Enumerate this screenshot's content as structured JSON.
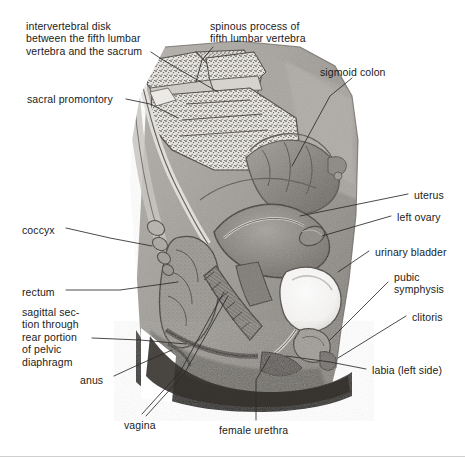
{
  "figure": {
    "style": "grayscale anatomical engraving",
    "width": 465,
    "height": 457,
    "background_color": "#ffffff",
    "text_color": "#1b1b1b",
    "leader_line_color": "#2a2a2a"
  },
  "labels": [
    {
      "id": "intervertebral-disk",
      "text": "intervertebral disk\nbetween the fifth lumbar\nvertebra and the sacrum",
      "lines": [
        "intervertebral disk",
        "between the fifth lumbar",
        "vertebra and the sacrum"
      ],
      "side": "left",
      "x": 26,
      "y": 20
    },
    {
      "id": "spinous-process",
      "text": "spinous process of\nfifth lumbar vertebra",
      "lines": [
        "spinous process of",
        "fifth lumbar vertebra"
      ],
      "side": "top",
      "x": 210,
      "y": 20
    },
    {
      "id": "sigmoid-colon",
      "text": "sigmoid colon",
      "lines": [
        "sigmoid colon"
      ],
      "side": "top-right",
      "x": 320,
      "y": 66
    },
    {
      "id": "sacral-promontory",
      "text": "sacral promontory",
      "lines": [
        "sacral promontory"
      ],
      "side": "left",
      "x": 27,
      "y": 93
    },
    {
      "id": "uterus",
      "text": "uterus",
      "lines": [
        "uterus"
      ],
      "side": "right",
      "x": 414,
      "y": 189
    },
    {
      "id": "left-ovary",
      "text": "left ovary",
      "lines": [
        "left ovary"
      ],
      "side": "right",
      "x": 397,
      "y": 211
    },
    {
      "id": "coccyx",
      "text": "coccyx",
      "lines": [
        "coccyx"
      ],
      "side": "left",
      "x": 22,
      "y": 224
    },
    {
      "id": "urinary-bladder",
      "text": "urinary bladder",
      "lines": [
        "urinary bladder"
      ],
      "side": "right",
      "x": 375,
      "y": 246
    },
    {
      "id": "rectum",
      "text": "rectum",
      "lines": [
        "rectum"
      ],
      "side": "left",
      "x": 22,
      "y": 286
    },
    {
      "id": "pubic-symphysis",
      "text": "pubic\nsymphysis",
      "lines": [
        "pubic",
        "symphysis"
      ],
      "side": "right",
      "x": 394,
      "y": 271
    },
    {
      "id": "clitoris",
      "text": "clitoris",
      "lines": [
        "clitoris"
      ],
      "side": "right",
      "x": 412,
      "y": 311
    },
    {
      "id": "pelvic-diaphragm",
      "text": "sagittal sec-\ntion through\nrear portion\nof pelvic\ndiaphragm",
      "lines": [
        "sagittal sec-",
        "tion through",
        "rear portion",
        "of pelvic",
        "diaphragm"
      ],
      "side": "left",
      "x": 22,
      "y": 306
    },
    {
      "id": "labia",
      "text": "labia (left side)",
      "lines": [
        "labia (left side)"
      ],
      "side": "right",
      "x": 372,
      "y": 364
    },
    {
      "id": "anus",
      "text": "anus",
      "lines": [
        "anus"
      ],
      "side": "left",
      "x": 80,
      "y": 374
    },
    {
      "id": "vagina",
      "text": "vagina",
      "lines": [
        "vagina"
      ],
      "side": "bottom",
      "x": 124,
      "y": 419
    },
    {
      "id": "female-urethra",
      "text": "female urethra",
      "lines": [
        "female urethra"
      ],
      "side": "bottom",
      "x": 219,
      "y": 424
    }
  ]
}
